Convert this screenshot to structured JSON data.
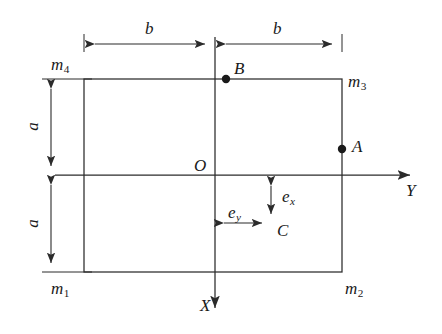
{
  "figure": {
    "type": "engineering-diagram",
    "background_color": "#ffffff",
    "line_color": "#2b2b2b",
    "text_color": "#1a1a1a"
  },
  "axes": {
    "x_axis": {
      "label": "X",
      "direction": "downward",
      "origin_label": "O",
      "label_x": 200,
      "label_y": 297
    },
    "y_axis": {
      "label": "Y",
      "direction": "rightward",
      "label_x": 406,
      "label_y": 182
    },
    "origin": {
      "label": "O",
      "label_x": 194,
      "label_y": 157,
      "x": 215,
      "y": 175
    }
  },
  "geometry": {
    "rect_left": 84,
    "rect_right": 342,
    "rect_top": 79,
    "rect_bottom": 272,
    "center_x": 215,
    "center_y": 175
  },
  "masses": [
    {
      "id": "m1",
      "base": "m",
      "index": "1",
      "corner": "bottom-left",
      "label_x": 51,
      "label_y": 280
    },
    {
      "id": "m2",
      "base": "m",
      "index": "2",
      "corner": "bottom-right",
      "label_x": 345,
      "label_y": 280
    },
    {
      "id": "m3",
      "base": "m",
      "index": "3",
      "corner": "top-right",
      "label_x": 348,
      "label_y": 73
    },
    {
      "id": "m4",
      "base": "m",
      "index": "4",
      "corner": "top-left",
      "label_x": 51,
      "label_y": 56
    }
  ],
  "dimensions": [
    {
      "id": "b-left",
      "label": "b",
      "orientation": "horizontal",
      "from": 84,
      "to": 215,
      "at": 44,
      "label_x": 145,
      "label_y": 20
    },
    {
      "id": "b-right",
      "label": "b",
      "orientation": "horizontal",
      "from": 215,
      "to": 342,
      "at": 44,
      "label_x": 273,
      "label_y": 20
    },
    {
      "id": "a-upper",
      "label": "a",
      "orientation": "vertical",
      "from": 79,
      "to": 175,
      "at": 51,
      "label_x": 28,
      "label_y": 118
    },
    {
      "id": "a-lower",
      "label": "a",
      "orientation": "vertical",
      "from": 175,
      "to": 272,
      "at": 51,
      "label_x": 28,
      "label_y": 215
    }
  ],
  "eccentricities": [
    {
      "id": "ex",
      "base": "e",
      "index": "x",
      "orientation": "vertical",
      "from": 177,
      "to": 223,
      "at": 271,
      "label_x": 282,
      "label_y": 188
    },
    {
      "id": "ey",
      "base": "e",
      "index": "y",
      "orientation": "horizontal",
      "from": 215,
      "to": 271,
      "at": 223,
      "label_x": 228,
      "label_y": 204
    }
  ],
  "points": [
    {
      "id": "A",
      "label": "A",
      "x": 342,
      "y": 149,
      "label_x": 352,
      "label_y": 138,
      "on": "right-edge"
    },
    {
      "id": "B",
      "label": "B",
      "x": 226,
      "y": 79,
      "label_x": 234,
      "label_y": 60,
      "on": "top-edge"
    },
    {
      "id": "C",
      "label": "C",
      "x": 271,
      "y": 223,
      "label_x": 277,
      "label_y": 222,
      "on": "eccentricity-corner"
    }
  ]
}
